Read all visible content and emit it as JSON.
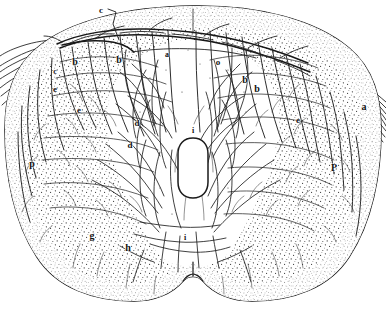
{
  "figure": {
    "kind": "anatomical-engraving",
    "background_color": "#ffffff",
    "ink_color": "#1a1a1a",
    "stipple_color": "#2a2a2a",
    "vessel_color": "#222222",
    "outline_color": "#141414"
  },
  "labels": [
    {
      "id": "label-c-top",
      "text": "c",
      "x": 101,
      "y": 10,
      "size": 9,
      "italic": false
    },
    {
      "id": "label-a-top-center",
      "text": "a",
      "x": 167,
      "y": 55,
      "size": 8,
      "italic": false
    },
    {
      "id": "label-o-right",
      "text": "o",
      "x": 218,
      "y": 62,
      "size": 9,
      "italic": false
    },
    {
      "id": "label-b-left-1",
      "text": "b",
      "x": 75,
      "y": 62,
      "size": 10,
      "italic": false
    },
    {
      "id": "label-b-left-2",
      "text": "b",
      "x": 119,
      "y": 60,
      "size": 10,
      "italic": false
    },
    {
      "id": "label-b-right-1",
      "text": "b",
      "x": 245,
      "y": 80,
      "size": 10,
      "italic": false
    },
    {
      "id": "label-b-right-2",
      "text": "b",
      "x": 257,
      "y": 89,
      "size": 10,
      "italic": false
    },
    {
      "id": "label-c-left",
      "text": "c",
      "x": 55,
      "y": 72,
      "size": 8,
      "italic": false
    },
    {
      "id": "label-e-left-1",
      "text": "e",
      "x": 55,
      "y": 89,
      "size": 9,
      "italic": false
    },
    {
      "id": "label-e-left-2",
      "text": "e",
      "x": 79,
      "y": 110,
      "size": 9,
      "italic": false
    },
    {
      "id": "label-e-right",
      "text": "e",
      "x": 298,
      "y": 120,
      "size": 9,
      "italic": false
    },
    {
      "id": "label-a-right",
      "text": "a",
      "x": 364,
      "y": 107,
      "size": 10,
      "italic": false
    },
    {
      "id": "label-d-upper",
      "text": "d",
      "x": 137,
      "y": 123,
      "size": 9,
      "italic": false
    },
    {
      "id": "label-d-lower",
      "text": "d",
      "x": 130,
      "y": 145,
      "size": 9,
      "italic": false
    },
    {
      "id": "label-i-canal",
      "text": "i",
      "x": 193,
      "y": 131,
      "size": 8,
      "italic": false
    },
    {
      "id": "label-p-left",
      "text": "p",
      "x": 32,
      "y": 164,
      "size": 10,
      "italic": false
    },
    {
      "id": "label-P-right",
      "text": "P",
      "x": 334,
      "y": 168,
      "size": 10,
      "italic": false
    },
    {
      "id": "label-g",
      "text": "g",
      "x": 92,
      "y": 236,
      "size": 10,
      "italic": false
    },
    {
      "id": "label-h",
      "text": "h",
      "x": 128,
      "y": 248,
      "size": 10,
      "italic": false
    },
    {
      "id": "label-i-bottom",
      "text": "i",
      "x": 185,
      "y": 238,
      "size": 8,
      "italic": false
    }
  ]
}
